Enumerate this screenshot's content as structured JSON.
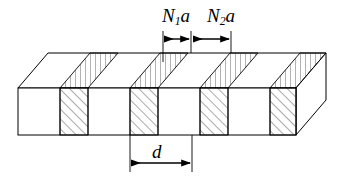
{
  "figure": {
    "type": "technical-diagram",
    "background_color": "#ffffff",
    "line_color": "#000000",
    "hatch_color": "#555555",
    "labels": {
      "n1a": {
        "base": "N",
        "subscript": "1",
        "suffix": "a",
        "full": "N₁a"
      },
      "n2a": {
        "base": "N",
        "subscript": "2",
        "suffix": "a",
        "full": "N₂a"
      },
      "period": {
        "full": "d"
      }
    },
    "dimension_lines": [
      {
        "name": "N1a",
        "label": "N₁a",
        "position": "top",
        "x_start": 163,
        "x_end": 190,
        "y": 39,
        "arrowheads": "both"
      },
      {
        "name": "N2a",
        "label": "N₂a",
        "position": "top",
        "x_start": 192,
        "x_end": 231,
        "y": 39,
        "arrowheads": "both"
      },
      {
        "name": "d",
        "label": "d",
        "position": "bottom",
        "x_start": 130,
        "x_end": 192,
        "y": 163,
        "arrowheads": "both"
      }
    ],
    "block": {
      "front_face": {
        "left": 18,
        "right": 296,
        "top": 88,
        "bottom": 135
      },
      "depth_offset": {
        "dx": 30,
        "dy": -35
      },
      "front_bands": [
        {
          "x": 18,
          "w": 42,
          "hatched": false
        },
        {
          "x": 60,
          "w": 28,
          "hatched": true
        },
        {
          "x": 88,
          "w": 42,
          "hatched": false
        },
        {
          "x": 130,
          "w": 28,
          "hatched": true
        },
        {
          "x": 158,
          "w": 42,
          "hatched": false
        },
        {
          "x": 200,
          "w": 28,
          "hatched": true
        },
        {
          "x": 228,
          "w": 42,
          "hatched": false
        },
        {
          "x": 270,
          "w": 26,
          "hatched": true
        }
      ],
      "front_hatch_style": "diagonal-45-up-right",
      "top_hatch_style": "vertical-lines",
      "side_face_hatched": false
    }
  }
}
